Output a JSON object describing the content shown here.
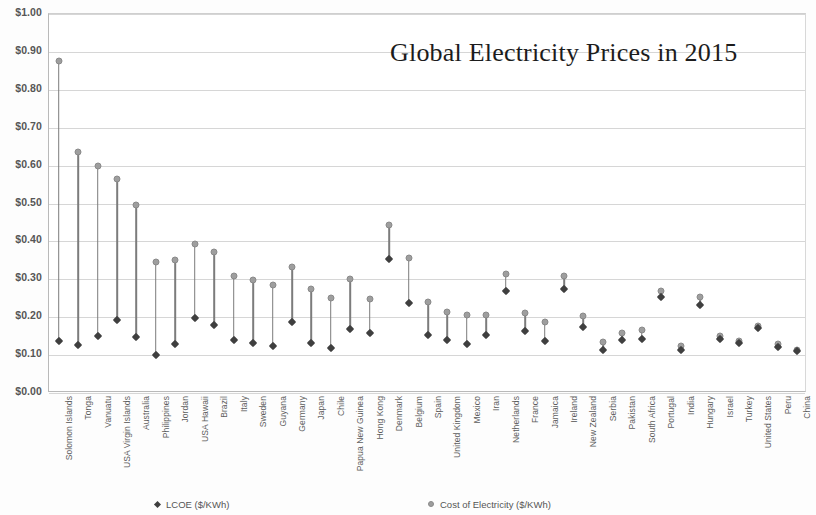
{
  "chart_data": {
    "type": "scatter",
    "title": "Global Electricity Prices in 2015",
    "xlabel": "",
    "ylabel": "",
    "ylim": [
      0,
      1.0
    ],
    "ytick_step": 0.1,
    "grid": true,
    "legend_position": "bottom",
    "categories": [
      "Solomon Islands",
      "Tonga",
      "Vanuatu",
      "USA Virgin Islands",
      "Australia",
      "Philippines",
      "Jordan",
      "USA Hawaii",
      "Brazil",
      "Italy",
      "Sweden",
      "Guyana",
      "Germany",
      "Japan",
      "Chile",
      "Papua New Guinea",
      "Hong Kong",
      "Denmark",
      "Belgium",
      "Spain",
      "United Kingdom",
      "Mexico",
      "Iran",
      "Netherlands",
      "France",
      "Jamaica",
      "Ireland",
      "New Zealand",
      "Serbia",
      "Pakistan",
      "South Africa",
      "Portugal",
      "India",
      "Hungary",
      "Israel",
      "Turkey",
      "United States",
      "Peru",
      "China"
    ],
    "ytick_labels": [
      "$1.00",
      "$0.90",
      "$0.80",
      "$0.70",
      "$0.60",
      "$0.50",
      "$0.40",
      "$0.30",
      "$0.20",
      "$0.10",
      "$0.00"
    ],
    "ytick_values": [
      1.0,
      0.9,
      0.8,
      0.7,
      0.6,
      0.5,
      0.4,
      0.3,
      0.2,
      0.1,
      0.0
    ],
    "series": [
      {
        "name": "Cost of Electricity  ($/KWh)",
        "marker": "circle",
        "color": "#9e9e9e",
        "values": [
          0.875,
          0.635,
          0.6,
          0.565,
          0.495,
          0.345,
          0.35,
          0.393,
          0.373,
          0.31,
          0.298,
          0.285,
          0.333,
          0.275,
          0.25,
          0.3,
          0.248,
          0.443,
          0.355,
          0.24,
          0.213,
          0.205,
          0.207,
          0.315,
          0.212,
          0.187,
          0.31,
          0.202,
          0.135,
          0.158,
          0.167,
          0.27,
          0.123,
          0.252,
          0.15,
          0.137,
          0.178,
          0.128,
          0.113
        ]
      },
      {
        "name": "LCOE ($/KWh)",
        "marker": "diamond",
        "color": "#3f3f3f",
        "values": [
          0.137,
          0.127,
          0.15,
          0.192,
          0.147,
          0.1,
          0.13,
          0.197,
          0.18,
          0.14,
          0.133,
          0.123,
          0.187,
          0.133,
          0.12,
          0.17,
          0.157,
          0.353,
          0.237,
          0.153,
          0.14,
          0.13,
          0.152,
          0.27,
          0.163,
          0.137,
          0.275,
          0.175,
          0.113,
          0.14,
          0.143,
          0.253,
          0.113,
          0.233,
          0.143,
          0.132,
          0.172,
          0.122,
          0.11
        ]
      }
    ]
  },
  "legend": {
    "lcoe_label": "LCOE ($/KWh)",
    "coe_label": "Cost of Electricity  ($/KWh)"
  }
}
